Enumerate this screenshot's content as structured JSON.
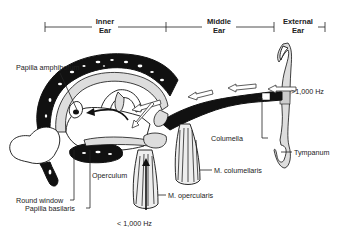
{
  "sections": [
    {
      "id": "inner",
      "line1": "Inner",
      "line2": "Ear"
    },
    {
      "id": "middle",
      "line1": "Middle",
      "line2": "Ear"
    },
    {
      "id": "external",
      "line1": "External",
      "line2": "Ear"
    }
  ],
  "labels": {
    "papilla_amphibiorum": "Papilla amphiborum",
    "columella": "Columella",
    "tympanum": "Tympanum",
    "m_columellaris": "M. columellaris",
    "operculum": "Operculum",
    "m_opercularis": "M. opercularis",
    "round_window": "Round window",
    "papilla_basilaris": "Papilla basilaris",
    "high_freq": ">1,000 Hz",
    "low_freq": "< 1,000 Hz"
  }
}
